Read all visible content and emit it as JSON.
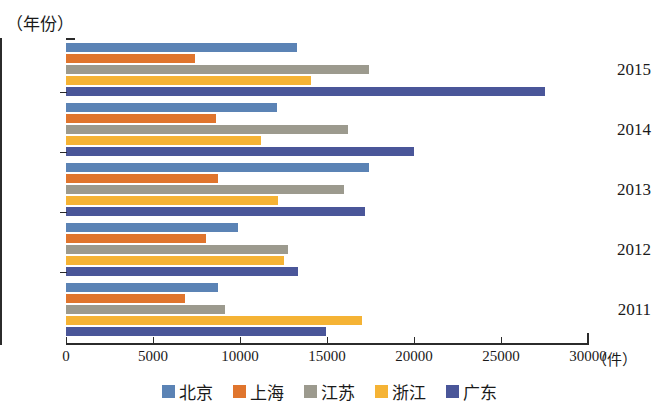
{
  "chart_data": {
    "type": "bar",
    "orientation": "horizontal",
    "title": "",
    "xlabel": "（件）",
    "ylabel": "（年份）",
    "xlim": [
      0,
      30000
    ],
    "xticks": [
      0,
      5000,
      10000,
      15000,
      20000,
      25000,
      30000
    ],
    "xtick_labels": [
      "0",
      "5000",
      "10000",
      "15000",
      "20000",
      "25000",
      "30000"
    ],
    "categories": [
      "2015",
      "2014",
      "2013",
      "2012",
      "2011"
    ],
    "grid": false,
    "legend_position": "bottom",
    "series": [
      {
        "name": "北京",
        "color": "#5b83b5",
        "values": [
          13300,
          12100,
          17400,
          9900,
          8750
        ]
      },
      {
        "name": "上海",
        "color": "#e0752d",
        "values": [
          7400,
          8600,
          8750,
          8050,
          6850
        ]
      },
      {
        "name": "江苏",
        "color": "#9c9a8e",
        "values": [
          17400,
          16200,
          15950,
          12750,
          9150
        ]
      },
      {
        "name": "浙江",
        "color": "#f5b335",
        "values": [
          14100,
          11200,
          12200,
          12500,
          17000
        ]
      },
      {
        "name": "广东",
        "color": "#4a5699",
        "values": [
          27500,
          20000,
          17200,
          13350,
          14950
        ]
      }
    ]
  },
  "axes": {
    "y_caption": "（年份）",
    "x_unit": "（件）"
  }
}
